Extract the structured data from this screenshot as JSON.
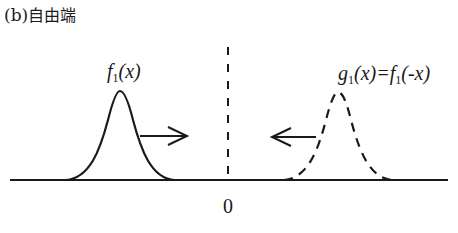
{
  "title": {
    "prefix": "(b)",
    "text": "自由端"
  },
  "labels": {
    "origin": "0",
    "incident_pulse": {
      "func": "f",
      "sub": "1",
      "arg": "(x)"
    },
    "reflected_pulse": {
      "func_g": "g",
      "sub_g": "1",
      "arg_g": "(x)=",
      "func_f": "f",
      "sub_f": "1",
      "arg_f": "(-x)"
    }
  },
  "colors": {
    "ink": "#1a1a1a",
    "background": "#ffffff"
  }
}
